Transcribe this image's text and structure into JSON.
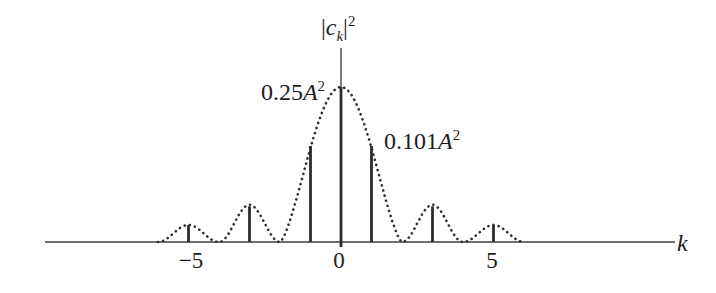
{
  "colors": {
    "background": "#ffffff",
    "axis": "#6f6f6f",
    "stem": "#2b2b2b",
    "dot": "#2e2e2e",
    "text": "#1d1d1d"
  },
  "texts": {
    "title": {
      "bar1": "|",
      "c": "c",
      "sub": "k",
      "bar2": "|",
      "sup": "2"
    },
    "peak_label": {
      "num": "0.25",
      "var": "A",
      "sup": "2"
    },
    "side_label": {
      "num": "0.101",
      "var": "A",
      "sup": "2"
    },
    "axis_label": "k",
    "ticks": [
      "−5",
      "0",
      "5"
    ]
  },
  "chart_data": {
    "type": "stem",
    "xlabel": "k",
    "ylabel": "|c_k|^2",
    "x_tick_values": [
      -5,
      0,
      5
    ],
    "x_tick_labels": [
      "−5",
      "0",
      "5"
    ],
    "stems": [
      {
        "k": -5,
        "rel_height": 0.11
      },
      {
        "k": -3,
        "rel_height": 0.23
      },
      {
        "k": -1,
        "rel_height": 0.62
      },
      {
        "k": 0,
        "rel_height": 1.0,
        "value_label": "0.25A^2"
      },
      {
        "k": 1,
        "rel_height": 0.62,
        "value_label": "0.101A^2"
      },
      {
        "k": 3,
        "rel_height": 0.23
      },
      {
        "k": 5,
        "rel_height": 0.11
      }
    ],
    "annotations": [
      {
        "text": "0.25A^2",
        "refers_to_k": 0
      },
      {
        "text": "0.101A^2",
        "refers_to_k": 1
      }
    ],
    "envelope": {
      "style": "dotted",
      "zeros_at_k": [
        -6,
        -4,
        -2,
        2,
        4,
        6
      ],
      "lobe_peaks_rel": [
        1.0,
        0.24,
        0.11
      ],
      "k_range": [
        -6,
        6
      ]
    },
    "x_axis_range_k": [
      -9.7,
      10.9
    ],
    "grid": false,
    "legend": false
  }
}
